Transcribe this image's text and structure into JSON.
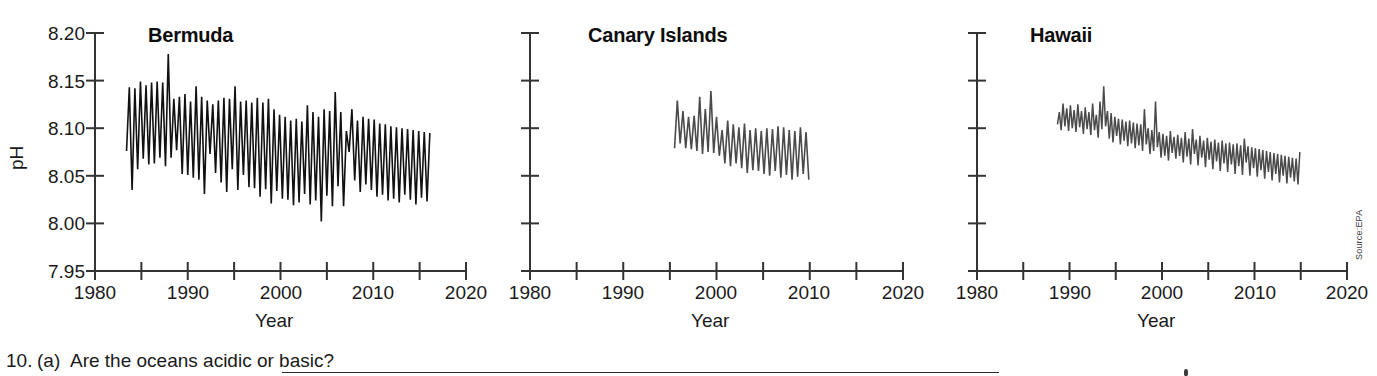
{
  "figure": {
    "source_note": "Source:EPA",
    "panels": [
      {
        "key": "bermuda",
        "title": "Bermuda",
        "xlabel": "Year",
        "ylabel": "pH",
        "show_y_axis_labels": true
      },
      {
        "key": "canary",
        "title": "Canary Islands",
        "xlabel": "Year",
        "ylabel": "",
        "show_y_axis_labels": false
      },
      {
        "key": "hawaii",
        "title": "Hawaii",
        "xlabel": "Year",
        "ylabel": "",
        "show_y_axis_labels": false
      }
    ]
  },
  "worksheet": {
    "question_number": "10.",
    "question_part": "(a)",
    "question_text": "Are the oceans acidic or basic?"
  },
  "chart_data": [
    {
      "type": "line",
      "title": "Bermuda",
      "xlabel": "Year",
      "ylabel": "pH",
      "xlim": [
        1980,
        2020
      ],
      "ylim": [
        7.95,
        8.2
      ],
      "xticks": [
        1980,
        1985,
        1990,
        1995,
        2000,
        2005,
        2010,
        2015,
        2020
      ],
      "xtick_labels": [
        "1980",
        "",
        "1990",
        "",
        "2000",
        "",
        "2010",
        "",
        "2020"
      ],
      "yticks": [
        7.95,
        8.0,
        8.05,
        8.1,
        8.15,
        8.2
      ],
      "ytick_labels": [
        "7.95",
        "8.00",
        "8.05",
        "8.10",
        "8.15",
        "8.20"
      ],
      "grid": false,
      "legend": "none",
      "line_color": "#111111",
      "line_width": 1.6,
      "series": [
        {
          "name": "Bermuda ocean pH",
          "x": [
            1983.4,
            1983.7,
            1984.0,
            1984.3,
            1984.6,
            1984.9,
            1985.2,
            1985.5,
            1985.8,
            1986.1,
            1986.4,
            1986.7,
            1987.0,
            1987.3,
            1987.6,
            1987.9,
            1988.2,
            1988.5,
            1988.8,
            1989.1,
            1989.4,
            1989.7,
            1990.0,
            1990.3,
            1990.6,
            1990.9,
            1991.2,
            1991.5,
            1991.8,
            1992.1,
            1992.4,
            1992.7,
            1993.0,
            1993.3,
            1993.6,
            1993.9,
            1994.2,
            1994.5,
            1994.8,
            1995.1,
            1995.4,
            1995.7,
            1996.0,
            1996.3,
            1996.6,
            1996.9,
            1997.2,
            1997.5,
            1997.8,
            1998.1,
            1998.4,
            1998.7,
            1999.0,
            1999.3,
            1999.6,
            1999.9,
            2000.2,
            2000.5,
            2000.8,
            2001.1,
            2001.4,
            2001.7,
            2002.0,
            2002.3,
            2002.6,
            2002.9,
            2003.2,
            2003.5,
            2003.8,
            2004.1,
            2004.4,
            2004.7,
            2005.0,
            2005.3,
            2005.6,
            2005.9,
            2006.2,
            2006.5,
            2006.8,
            2007.1,
            2007.4,
            2007.7,
            2008.0,
            2008.3,
            2008.6,
            2008.9,
            2009.2,
            2009.5,
            2009.8,
            2010.1,
            2010.4,
            2010.7,
            2011.0,
            2011.3,
            2011.6,
            2011.9,
            2012.2,
            2012.5,
            2012.8,
            2013.1,
            2013.4,
            2013.7,
            2014.0,
            2014.3,
            2014.6,
            2014.9,
            2015.2,
            2015.5,
            2015.8,
            2016.1
          ],
          "y": [
            8.076,
            8.143,
            8.035,
            8.142,
            8.057,
            8.149,
            8.068,
            8.145,
            8.062,
            8.148,
            8.063,
            8.149,
            8.069,
            8.148,
            8.06,
            8.178,
            8.069,
            8.131,
            8.077,
            8.133,
            8.052,
            8.136,
            8.051,
            8.128,
            8.048,
            8.144,
            8.046,
            8.133,
            8.031,
            8.129,
            8.073,
            8.125,
            8.053,
            8.129,
            8.043,
            8.132,
            8.033,
            8.131,
            8.057,
            8.144,
            8.035,
            8.128,
            8.051,
            8.129,
            8.038,
            8.127,
            8.037,
            8.132,
            8.028,
            8.127,
            8.036,
            8.131,
            8.021,
            8.12,
            8.034,
            8.114,
            8.026,
            8.112,
            8.025,
            8.108,
            8.019,
            8.11,
            8.022,
            8.107,
            8.031,
            8.124,
            8.02,
            8.117,
            8.024,
            8.112,
            8.002,
            8.12,
            8.029,
            8.118,
            8.018,
            8.138,
            8.039,
            8.117,
            8.018,
            8.097,
            8.075,
            8.12,
            8.045,
            8.108,
            8.033,
            8.112,
            8.041,
            8.11,
            8.035,
            8.109,
            8.028,
            8.105,
            8.03,
            8.104,
            8.024,
            8.102,
            8.026,
            8.101,
            8.022,
            8.1,
            8.03,
            8.099,
            8.025,
            8.098,
            8.02,
            8.097,
            8.027,
            8.096,
            8.023,
            8.095
          ]
        }
      ]
    },
    {
      "type": "line",
      "title": "Canary Islands",
      "xlabel": "Year",
      "ylabel": "pH",
      "xlim": [
        1980,
        2020
      ],
      "ylim": [
        7.95,
        8.2
      ],
      "xticks": [
        1980,
        1985,
        1990,
        1995,
        2000,
        2005,
        2010,
        2015,
        2020
      ],
      "xtick_labels": [
        "1980",
        "",
        "1990",
        "",
        "2000",
        "",
        "2010",
        "",
        "2020"
      ],
      "yticks": [
        7.95,
        8.0,
        8.05,
        8.1,
        8.15,
        8.2
      ],
      "ytick_labels": [
        "",
        "",
        "",
        "",
        "",
        ""
      ],
      "grid": false,
      "legend": "none",
      "line_color": "#4a4a4a",
      "line_width": 1.6,
      "series": [
        {
          "name": "Canary Islands ocean pH",
          "x": [
            1995.5,
            1995.8,
            1996.1,
            1996.4,
            1996.7,
            1997.0,
            1997.3,
            1997.6,
            1997.9,
            1998.2,
            1998.5,
            1998.8,
            1999.1,
            1999.4,
            1999.7,
            2000.0,
            2000.3,
            2000.6,
            2000.9,
            2001.2,
            2001.5,
            2001.8,
            2002.1,
            2002.4,
            2002.7,
            2003.0,
            2003.3,
            2003.6,
            2003.9,
            2004.2,
            2004.5,
            2004.8,
            2005.1,
            2005.4,
            2005.7,
            2006.0,
            2006.3,
            2006.6,
            2006.9,
            2007.2,
            2007.5,
            2007.8,
            2008.1,
            2008.4,
            2008.7,
            2009.0,
            2009.3,
            2009.6,
            2009.9
          ],
          "y": [
            8.079,
            8.129,
            8.084,
            8.118,
            8.079,
            8.112,
            8.078,
            8.113,
            8.076,
            8.133,
            8.073,
            8.12,
            8.075,
            8.139,
            8.074,
            8.112,
            8.071,
            8.098,
            8.063,
            8.108,
            8.06,
            8.104,
            8.063,
            8.101,
            8.058,
            8.105,
            8.053,
            8.098,
            8.056,
            8.1,
            8.055,
            8.097,
            8.052,
            8.1,
            8.05,
            8.099,
            8.055,
            8.102,
            8.048,
            8.101,
            8.051,
            8.098,
            8.046,
            8.097,
            8.049,
            8.101,
            8.052,
            8.096,
            8.046
          ]
        }
      ]
    },
    {
      "type": "line",
      "title": "Hawaii",
      "xlabel": "Year",
      "ylabel": "pH",
      "xlim": [
        1980,
        2020
      ],
      "ylim": [
        7.95,
        8.2
      ],
      "xticks": [
        1980,
        1985,
        1990,
        1995,
        2000,
        2005,
        2010,
        2015,
        2020
      ],
      "xtick_labels": [
        "1980",
        "",
        "1990",
        "",
        "2000",
        "",
        "2010",
        "",
        "2020"
      ],
      "yticks": [
        7.95,
        8.0,
        8.05,
        8.1,
        8.15,
        8.2
      ],
      "ytick_labels": [
        "",
        "",
        "",
        "",
        "",
        ""
      ],
      "grid": false,
      "legend": "none",
      "line_color": "#4a4a4a",
      "line_width": 1.5,
      "series": [
        {
          "name": "Hawaii ocean pH",
          "x": [
            1988.7,
            1988.9,
            1989.1,
            1989.3,
            1989.5,
            1989.7,
            1989.9,
            1990.1,
            1990.3,
            1990.5,
            1990.7,
            1990.9,
            1991.1,
            1991.3,
            1991.5,
            1991.7,
            1991.9,
            1992.1,
            1992.3,
            1992.5,
            1992.7,
            1992.9,
            1993.1,
            1993.3,
            1993.5,
            1993.7,
            1993.9,
            1994.1,
            1994.3,
            1994.5,
            1994.7,
            1994.9,
            1995.1,
            1995.3,
            1995.5,
            1995.7,
            1995.9,
            1996.1,
            1996.3,
            1996.5,
            1996.7,
            1996.9,
            1997.1,
            1997.3,
            1997.5,
            1997.7,
            1997.9,
            1998.1,
            1998.3,
            1998.5,
            1998.7,
            1998.9,
            1999.1,
            1999.3,
            1999.5,
            1999.7,
            1999.9,
            2000.1,
            2000.3,
            2000.5,
            2000.7,
            2000.9,
            2001.1,
            2001.3,
            2001.5,
            2001.7,
            2001.9,
            2002.1,
            2002.3,
            2002.5,
            2002.7,
            2002.9,
            2003.1,
            2003.3,
            2003.5,
            2003.7,
            2003.9,
            2004.1,
            2004.3,
            2004.5,
            2004.7,
            2004.9,
            2005.1,
            2005.3,
            2005.5,
            2005.7,
            2005.9,
            2006.1,
            2006.3,
            2006.5,
            2006.7,
            2006.9,
            2007.1,
            2007.3,
            2007.5,
            2007.7,
            2007.9,
            2008.1,
            2008.3,
            2008.5,
            2008.7,
            2008.9,
            2009.1,
            2009.3,
            2009.5,
            2009.7,
            2009.9,
            2010.1,
            2010.3,
            2010.5,
            2010.7,
            2010.9,
            2011.1,
            2011.3,
            2011.5,
            2011.7,
            2011.9,
            2012.1,
            2012.3,
            2012.5,
            2012.7,
            2012.9,
            2013.1,
            2013.3,
            2013.5,
            2013.7,
            2013.9,
            2014.1,
            2014.3,
            2014.5,
            2014.7,
            2014.9
          ],
          "y": [
            8.104,
            8.117,
            8.098,
            8.126,
            8.102,
            8.121,
            8.097,
            8.124,
            8.1,
            8.119,
            8.096,
            8.125,
            8.101,
            8.118,
            8.094,
            8.122,
            8.099,
            8.117,
            8.093,
            8.126,
            8.098,
            8.114,
            8.09,
            8.128,
            8.099,
            8.144,
            8.102,
            8.118,
            8.089,
            8.116,
            8.085,
            8.112,
            8.092,
            8.11,
            8.083,
            8.109,
            8.087,
            8.107,
            8.081,
            8.108,
            8.084,
            8.106,
            8.079,
            8.105,
            8.082,
            8.104,
            8.076,
            8.12,
            8.083,
            8.1,
            8.073,
            8.098,
            8.076,
            8.128,
            8.08,
            8.096,
            8.069,
            8.094,
            8.071,
            8.092,
            8.066,
            8.097,
            8.074,
            8.091,
            8.068,
            8.093,
            8.071,
            8.09,
            8.064,
            8.096,
            8.07,
            8.089,
            8.062,
            8.099,
            8.073,
            8.088,
            8.061,
            8.092,
            8.069,
            8.087,
            8.059,
            8.09,
            8.067,
            8.086,
            8.057,
            8.088,
            8.065,
            8.085,
            8.055,
            8.087,
            8.063,
            8.084,
            8.054,
            8.085,
            8.062,
            8.083,
            8.052,
            8.084,
            8.06,
            8.082,
            8.051,
            8.089,
            8.064,
            8.081,
            8.05,
            8.08,
            8.058,
            8.079,
            8.049,
            8.078,
            8.056,
            8.077,
            8.047,
            8.076,
            8.054,
            8.075,
            8.045,
            8.074,
            8.052,
            8.073,
            8.043,
            8.072,
            8.05,
            8.071,
            8.042,
            8.07,
            8.048,
            8.069,
            8.044,
            8.068,
            8.041,
            8.075
          ]
        }
      ]
    }
  ]
}
